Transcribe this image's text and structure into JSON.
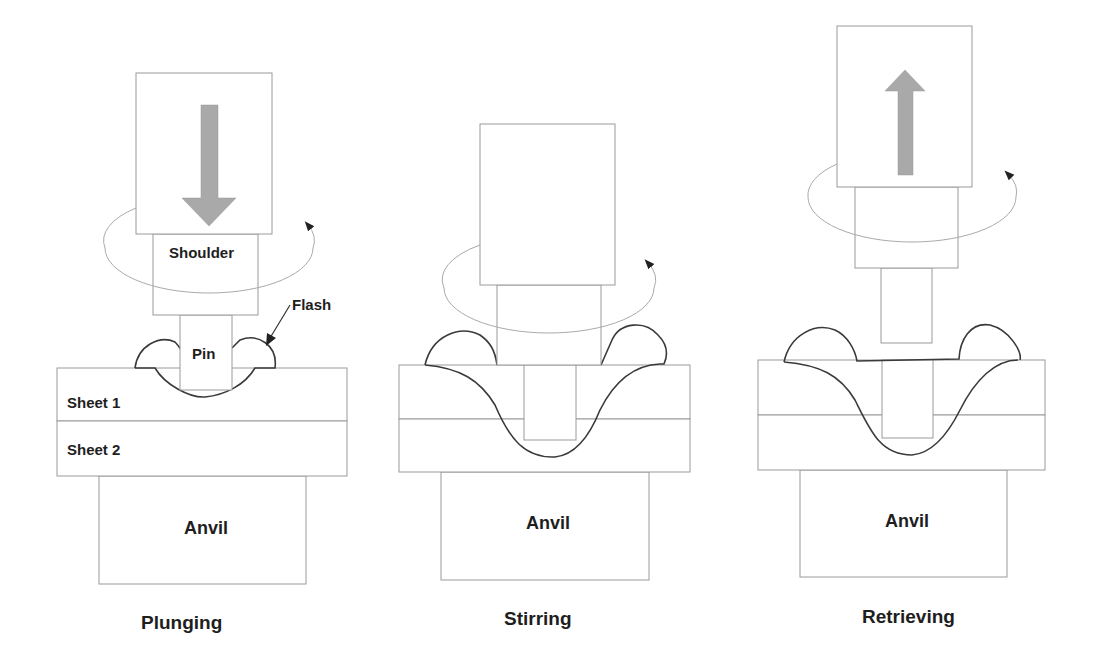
{
  "colors": {
    "outline": "#9a9a9a",
    "weld_curve": "#3a3a3a",
    "arrow_fill": "#a9a9a9",
    "text": "#1e1e1e",
    "background": "#ffffff"
  },
  "panels": [
    {
      "id": "plunging",
      "caption": "Plunging",
      "motion": "down-arrow",
      "labels": {
        "shoulder": "Shoulder",
        "pin": "Pin",
        "flash": "Flash",
        "sheet1": "Sheet 1",
        "sheet2": "Sheet 2",
        "anvil": "Anvil"
      }
    },
    {
      "id": "stirring",
      "caption": "Stirring",
      "motion": "none",
      "labels": {
        "anvil": "Anvil"
      }
    },
    {
      "id": "retrieving",
      "caption": "Retrieving",
      "motion": "up-arrow",
      "labels": {
        "anvil": "Anvil"
      }
    }
  ]
}
